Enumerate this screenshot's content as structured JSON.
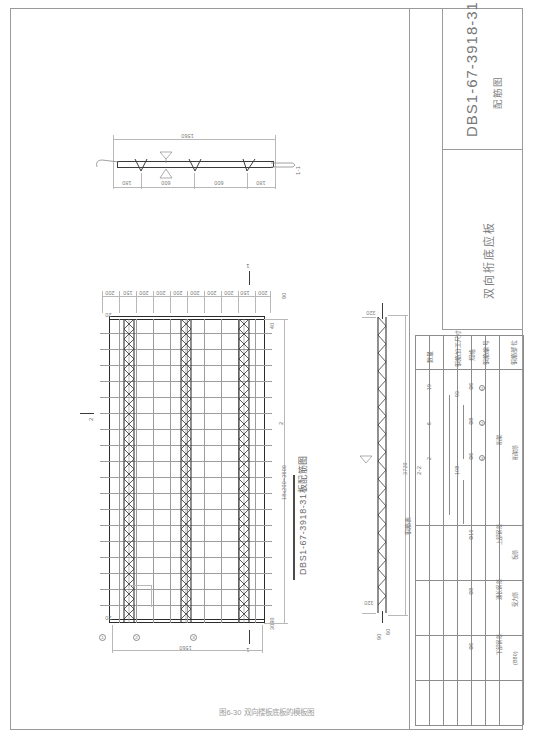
{
  "sheet": {
    "caption": "图6-30  双向楼板底板的模板图"
  },
  "title_block": {
    "code": "DBS1-67-3918-31",
    "drawing_type": "配筋图",
    "product_name": "双向桁底应板",
    "product_name_full": "双向板底板"
  },
  "views": {
    "section_1_1": {
      "label": "1-1",
      "total_width": "1560",
      "dims": [
        "180",
        "600",
        "600",
        "180"
      ],
      "thickness_note": "60"
    },
    "plan": {
      "title": "DBS1-67-3918-31板配筋图",
      "bottom_width": "1560",
      "right_dim": "18x200=3600",
      "top_dims": [
        "200",
        "150",
        "200",
        "200",
        "200",
        "200",
        "200",
        "200",
        "150",
        "200"
      ],
      "edge_left": "90",
      "edge_right": "90",
      "corner_dim_tl": "20",
      "corner_dim_bl": "20",
      "corner_dim_tr": "40",
      "corner_dim_br": "3090",
      "section_marks": [
        "1",
        "1",
        "2",
        "2"
      ],
      "bubbles": [
        "1",
        "2",
        "3"
      ]
    },
    "section_2_2": {
      "label": "2-2",
      "length": "3720",
      "end_dim_top": "320",
      "end_dim_bottom": "320",
      "height_note": "90",
      "thickness": "60"
    }
  },
  "schedule": {
    "title": "钢筋表",
    "headers": {
      "part": "钢筋部位",
      "sub": "",
      "number": "钢筋编号",
      "diameter": "规格",
      "shape": "钢筋加工尺寸",
      "count": "数量"
    },
    "rows": [
      {
        "part": "桁架筋",
        "sub": "桁架",
        "number": "1",
        "diameter": "Φ6",
        "shape_len": "93",
        "count": "19"
      },
      {
        "part": "",
        "sub": "",
        "number": "2",
        "diameter": "Φ8",
        "shape_len": "",
        "count": "6"
      },
      {
        "part": "",
        "sub": "",
        "number": "3",
        "diameter": "Φ6",
        "shape_len": "108",
        "count": "2"
      },
      {
        "part": "板筋",
        "sub": "上部钢筋",
        "number": "",
        "diameter": "Φ10",
        "shape_len": "",
        "count": ""
      },
      {
        "part": "受力筋",
        "sub": "通长钢筋",
        "number": "",
        "diameter": "Φ8",
        "shape_len": "",
        "count": ""
      },
      {
        "part": "(B80)",
        "sub": "下部钢筋",
        "number": "",
        "diameter": "Φ6",
        "shape_len": "",
        "count": ""
      }
    ]
  }
}
